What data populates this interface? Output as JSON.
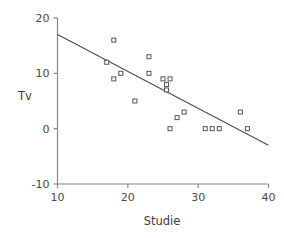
{
  "chart_data": {
    "type": "scatter",
    "title": "",
    "xlabel": "Studie",
    "ylabel": "Tv",
    "xlim": [
      10,
      40
    ],
    "ylim": [
      -10,
      20
    ],
    "xticks": [
      10,
      20,
      30,
      40
    ],
    "yticks": [
      -10,
      0,
      10,
      20
    ],
    "xtick_labels": [
      "10",
      "20",
      "30",
      "40"
    ],
    "ytick_labels": [
      "-10",
      "0",
      "10",
      "20"
    ],
    "grid": false,
    "legend": "none",
    "marker": "open-square",
    "marker_color": "#555555",
    "line_color": "#4d4d4d",
    "axis_color": "#888888",
    "points": [
      {
        "x": 17,
        "y": 12
      },
      {
        "x": 18,
        "y": 16
      },
      {
        "x": 18,
        "y": 9
      },
      {
        "x": 19,
        "y": 10
      },
      {
        "x": 21,
        "y": 5
      },
      {
        "x": 23,
        "y": 13
      },
      {
        "x": 23,
        "y": 10
      },
      {
        "x": 25,
        "y": 9
      },
      {
        "x": 26,
        "y": 9
      },
      {
        "x": 25.5,
        "y": 8
      },
      {
        "x": 25.5,
        "y": 7
      },
      {
        "x": 26,
        "y": 0
      },
      {
        "x": 27,
        "y": 2
      },
      {
        "x": 28,
        "y": 3
      },
      {
        "x": 31,
        "y": 0
      },
      {
        "x": 32,
        "y": 0
      },
      {
        "x": 33,
        "y": 0
      },
      {
        "x": 36,
        "y": 3
      },
      {
        "x": 37,
        "y": 0
      }
    ],
    "trendline": {
      "x_start": 10,
      "y_start": 17,
      "x_end": 40,
      "y_end": -3
    }
  }
}
